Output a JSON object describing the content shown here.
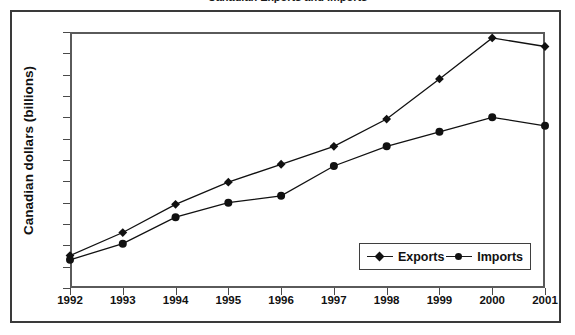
{
  "figure": {
    "title_fragment": "Canadian Exports and Imports",
    "background_color": "#ffffff",
    "frame_color": "#3a3a3a",
    "axis_color": "#5a5a5a",
    "series_color": "#111111"
  },
  "chart_data": {
    "type": "line",
    "title": "",
    "xlabel": "",
    "ylabel": "Canadian dollars (billions)",
    "categories": [
      "1992",
      "1993",
      "1994",
      "1995",
      "1996",
      "1997",
      "1998",
      "1999",
      "2000",
      "2001"
    ],
    "x": [
      1992,
      1993,
      1994,
      1995,
      1996,
      1997,
      1998,
      1999,
      2000,
      2001
    ],
    "series": [
      {
        "name": "Exports",
        "marker": "diamond",
        "values": [
          138,
          165,
          198,
          224,
          245,
          266,
          298,
          345,
          393,
          383
        ]
      },
      {
        "name": "Imports",
        "marker": "circle",
        "values": [
          133,
          152,
          183,
          200,
          208,
          243,
          266,
          283,
          300,
          290
        ]
      }
    ],
    "ylim": [
      100,
      400
    ],
    "ytick_step": 25,
    "yticks": [
      400,
      375,
      350,
      325,
      300,
      275,
      250,
      225,
      200,
      175,
      150,
      125,
      100
    ],
    "grid": false,
    "legend_position": "inside-bottom-right"
  },
  "legend": {
    "entries": [
      {
        "label": "Exports",
        "marker": "diamond"
      },
      {
        "label": "Imports",
        "marker": "circle"
      }
    ]
  }
}
